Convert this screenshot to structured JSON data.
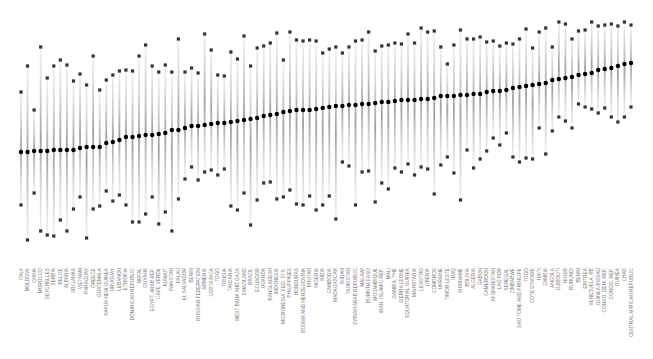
{
  "chart_data": {
    "type": "scatter",
    "subtype": "range-dot-plot",
    "title": "",
    "xlabel": "",
    "ylabel": "",
    "grid": false,
    "legend": null,
    "marker_styles": {
      "median": {
        "shape": "circle",
        "color": "#000000"
      },
      "upper": {
        "shape": "square",
        "color": "#333333"
      },
      "lower": {
        "shape": "square",
        "color": "#333333"
      },
      "range_line": {
        "color": "#c8c8c8",
        "gradient": true
      }
    },
    "y_pixel_space": {
      "top": 0,
      "bottom": 260,
      "note": "values are screen y-coordinates; smaller = higher"
    },
    "categories": [
      "ITALY",
      "MOLDOVA",
      "CHINA",
      "MOROCCO",
      "SEYCHELLES",
      "SERBIA",
      "BELIZE",
      "ALBANIA",
      "SRI LANKA",
      "VIETNAM",
      "PARAGUAY",
      "GREECE",
      "GUATEMALA",
      "PAPUA NEW GUINEA",
      "URUGUAY",
      "LEBANON",
      "ETHIOPIA",
      "DOMINICAN REPUBLIC",
      "NEPAL",
      "GUYANA",
      "EGYPT, ARAB REP.",
      "CAPE VERDE",
      "KUWAIT",
      "PAKISTAN",
      "PALAU",
      "EL SALVADOR",
      "BENIN",
      "RUSSIAN FEDERATION",
      "ARMENIA",
      "COSTA RICA",
      "TOGO",
      "TUNISIA",
      "TANZANIA",
      "WEST BANK AND GAZA",
      "SWAZILAND",
      "BRAZIL",
      "ECUADOR",
      "UGANDA",
      "BANGLADESH",
      "INDONESIA",
      "MICRONESIA, FED. STS.",
      "PHILIPPINES",
      "HONDURAS",
      "BOSNIA AND HERZEGOVINA",
      "BHUTAN",
      "NIGERIA",
      "INDIA",
      "CAMBODIA",
      "MADAGASCAR",
      "SUDAN",
      "TAJIKISTAN",
      "SYRIAN ARAB REPUBLIC",
      "MALAWI",
      "BURKINA FASO",
      "MOZAMBIQUE",
      "IRAN, ISLAMIC REP.",
      "MALI",
      "GAMBIA, THE",
      "SIERRA LEONE",
      "EQUATORIAL GUINEA",
      "MAURITANIA",
      "LESOTHO",
      "LIBERIA",
      "COMOROS",
      "UKRAINE",
      "TIMOR-LESTE",
      "IRAQ",
      "SURINAME",
      "BOLIVIA",
      "ALGERIA",
      "GABON",
      "CAMEROON",
      "AFGHANISTAN",
      "LAO PDR",
      "SENEGAL",
      "ZIMBABWE",
      "SAO TOME AND PRINCIPE",
      "TOGO",
      "COTE D'IVOIRE",
      "HAITI",
      "ZAMBIA",
      "ANGOLA",
      "DJIBOUTI",
      "NIGER",
      "BURUNDI",
      "BENIN",
      "ERITREA",
      "VENEZUELA, RB",
      "GUINEA-BISSAU",
      "CONGO, DEM. REP.",
      "CONGO, REP.",
      "GUINEA",
      "CHAD",
      "CENTRAL AFRICAN REPUBLIC"
    ],
    "median_y": [
      152,
      152,
      151,
      151,
      151,
      151,
      150,
      150,
      150,
      150,
      150,
      148,
      148,
      147,
      147,
      147,
      146,
      143,
      142,
      140,
      138,
      137,
      137,
      136,
      136,
      135,
      135,
      134,
      133,
      131,
      130,
      130,
      128,
      127,
      126,
      126,
      125,
      124,
      124,
      123,
      123,
      122,
      121,
      121,
      120,
      119,
      118,
      118,
      116,
      115,
      114,
      113,
      112,
      111,
      110,
      110,
      110,
      110,
      109,
      108,
      108,
      107,
      106,
      106,
      106,
      105,
      105,
      104,
      104,
      103,
      103,
      102,
      102,
      101,
      101,
      100,
      100,
      100,
      99,
      99,
      99,
      98,
      97,
      96,
      96,
      96,
      95,
      95,
      95,
      94,
      94,
      93,
      92,
      91,
      91,
      90,
      89,
      88,
      87,
      86,
      86,
      85,
      84,
      83,
      82,
      80,
      79,
      78,
      77,
      76,
      75,
      74,
      73,
      71,
      70,
      69,
      68,
      66,
      65,
      64,
      63
    ],
    "upper_y": [
      92,
      66,
      68,
      110,
      47,
      78,
      66,
      51,
      60,
      65,
      81,
      74,
      71,
      85,
      56,
      90,
      80,
      85,
      75,
      71,
      70,
      71,
      46,
      56,
      45,
      66,
      72,
      36,
      65,
      72,
      39,
      72,
      64,
      68,
      73,
      34,
      50,
      86,
      75,
      76,
      52,
      33,
      59,
      36,
      66,
      48,
      53,
      46,
      43,
      33,
      60,
      54,
      32,
      40,
      41,
      40,
      32,
      41,
      53,
      49,
      47,
      32,
      53,
      47,
      41,
      40,
      32,
      32,
      51,
      46,
      45,
      28,
      43,
      44,
      34,
      43,
      25,
      28,
      32,
      31,
      52,
      47,
      64,
      45,
      30,
      29,
      39,
      39,
      37,
      42,
      41,
      41,
      46,
      43,
      44,
      41,
      39,
      29,
      48,
      32,
      37,
      28,
      47,
      22,
      24,
      24,
      39,
      31,
      30,
      22,
      29,
      26,
      25,
      24,
      26,
      24,
      22,
      25
    ],
    "lower_y": [
      205,
      240,
      225,
      193,
      231,
      235,
      236,
      231,
      220,
      231,
      209,
      197,
      209,
      238,
      209,
      206,
      191,
      192,
      201,
      195,
      205,
      222,
      200,
      222,
      214,
      197,
      224,
      203,
      212,
      231,
      199,
      179,
      183,
      167,
      180,
      172,
      170,
      166,
      175,
      169,
      206,
      207,
      210,
      193,
      225,
      200,
      202,
      183,
      182,
      199,
      197,
      194,
      190,
      204,
      205,
      196,
      195,
      210,
      205,
      196,
      219,
      210,
      162,
      166,
      205,
      172,
      194,
      171,
      202,
      183,
      189,
      195,
      168,
      172,
      164,
      175,
      153,
      167,
      169,
      194,
      176,
      165,
      157,
      173,
      200,
      187,
      150,
      168,
      159,
      151,
      144,
      138,
      145,
      133,
      157,
      135,
      162,
      158,
      159,
      128,
      145,
      154,
      131,
      117,
      121,
      109,
      128,
      104,
      107,
      109,
      106,
      113,
      108,
      117,
      122,
      108,
      117,
      107
    ],
    "x_range_px": [
      21,
      631
    ]
  }
}
